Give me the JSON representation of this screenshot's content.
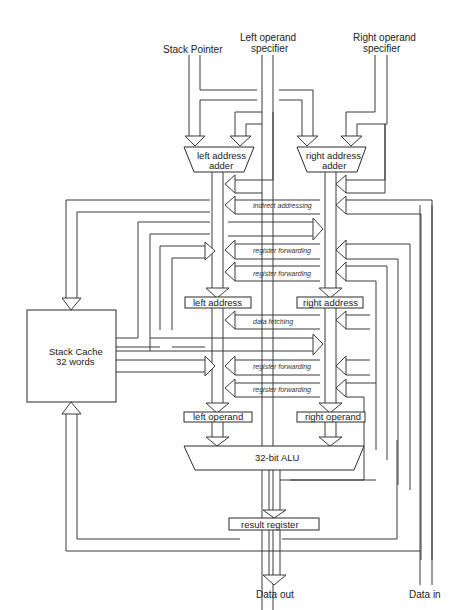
{
  "diagram": {
    "inputs": {
      "stack_pointer": "Stack Pointer",
      "left_operand_specifier_l1": "Left operand",
      "left_operand_specifier_l2": "specifier",
      "right_operand_specifier_l1": "Right operand",
      "right_operand_specifier_l2": "specifier"
    },
    "blocks": {
      "left_address_adder_l1": "left address",
      "left_address_adder_l2": "adder",
      "right_address_adder_l1": "right address",
      "right_address_adder_l2": "adder",
      "left_address": "left address",
      "right_address": "right address",
      "left_operand": "left operand",
      "right_operand": "right operand",
      "alu": "32-bit ALU",
      "result_register": "result register",
      "stack_cache_l1": "Stack Cache",
      "stack_cache_l2": "32 words"
    },
    "paths": {
      "indirect_addressing": "indirect addressing",
      "register_forwarding_1": "register forwarding",
      "register_forwarding_2": "register forwarding",
      "data_fetching": "data fetching",
      "register_forwarding_3": "register forwarding",
      "register_forwarding_4": "register forwarding"
    },
    "outputs": {
      "data_out": "Data out",
      "data_in": "Data in"
    }
  }
}
